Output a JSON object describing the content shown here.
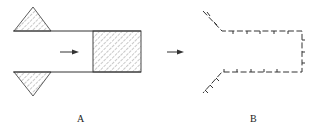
{
  "figure": {
    "panels": [
      {
        "id": "A",
        "label": "A",
        "description": "Tube with hatched triangular blocks above and below its left end, arrow pointing right, hatched rectangular block at right end"
      },
      {
        "id": "B",
        "label": "B",
        "description": "Dashed outline with tick marks forming a funnel-shaped contour open to the left, arrow pointing right"
      }
    ],
    "colors": {
      "line": "#333333",
      "hatch": "#666666"
    }
  }
}
